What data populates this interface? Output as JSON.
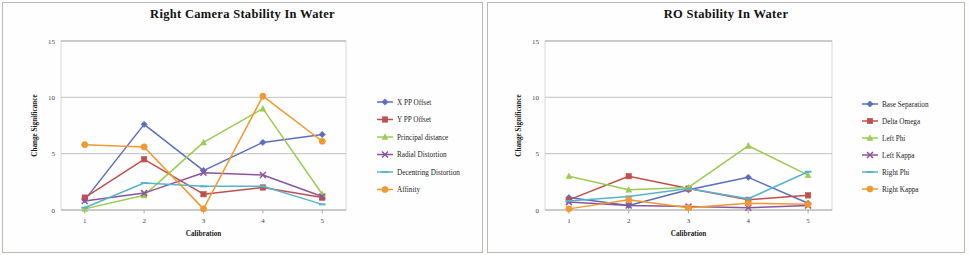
{
  "page": {
    "background_color": "#fdfdfb",
    "panel_border_color": "#b9b9b9"
  },
  "charts": [
    {
      "id": "right-camera-stability",
      "title": "Right Camera Stability In Water",
      "xlabel": "Calibration",
      "ylabel": "Change Significance"
    },
    {
      "id": "ro-stability",
      "title": "RO Stability In Water",
      "xlabel": "Calibration",
      "ylabel": "Change Significance"
    }
  ],
  "chart_data": [
    {
      "type": "line",
      "title": "Right Camera Stability In Water",
      "xlabel": "Calibration",
      "ylabel": "Change Significance",
      "categories": [
        "1",
        "2",
        "3",
        "4",
        "5"
      ],
      "x": [
        1,
        2,
        3,
        4,
        5
      ],
      "xlim": [
        0.6,
        5.4
      ],
      "ylim": [
        0,
        15
      ],
      "yticks": [
        0,
        5,
        10,
        15
      ],
      "ytick_labels": [
        "0",
        "5",
        "10",
        "15"
      ],
      "grid": true,
      "legend_position": "right",
      "series": [
        {
          "name": "X PP Offset",
          "color": "#5b6fbd",
          "marker": "diamond",
          "values": [
            0.9,
            7.6,
            3.5,
            6.0,
            6.7
          ]
        },
        {
          "name": "Y PP Offset",
          "color": "#c0504d",
          "marker": "square",
          "values": [
            1.1,
            4.5,
            1.4,
            2.0,
            1.1
          ]
        },
        {
          "name": "Principal distance",
          "color": "#9bcb50",
          "marker": "triangle",
          "values": [
            0.1,
            1.3,
            6.0,
            9.0,
            1.4
          ]
        },
        {
          "name": "Radial Distortion",
          "color": "#8b559c",
          "marker": "cross",
          "values": [
            0.8,
            1.5,
            3.3,
            3.1,
            1.2
          ]
        },
        {
          "name": "Decentring Distortion",
          "color": "#57b4cd",
          "marker": "line",
          "values": [
            0.2,
            2.4,
            2.1,
            2.1,
            0.5
          ]
        },
        {
          "name": "Affinity",
          "color": "#f0992f",
          "marker": "circle",
          "values": [
            5.8,
            5.6,
            0.1,
            10.1,
            6.1
          ]
        }
      ]
    },
    {
      "type": "line",
      "title": "RO Stability In Water",
      "xlabel": "Calibration",
      "ylabel": "Change Significance",
      "categories": [
        "1",
        "2",
        "3",
        "4",
        "5"
      ],
      "x": [
        1,
        2,
        3,
        4,
        5
      ],
      "xlim": [
        0.6,
        5.4
      ],
      "ylim": [
        0,
        15
      ],
      "yticks": [
        0,
        5,
        10,
        15
      ],
      "ytick_labels": [
        "0",
        "5",
        "10",
        "15"
      ],
      "grid": true,
      "legend_position": "right",
      "series": [
        {
          "name": "Base Separation",
          "color": "#5b6fbd",
          "marker": "diamond",
          "values": [
            1.1,
            0.4,
            1.8,
            2.9,
            0.6
          ]
        },
        {
          "name": "Delta Omega",
          "color": "#c0504d",
          "marker": "square",
          "values": [
            0.9,
            3.0,
            1.9,
            0.9,
            1.3
          ]
        },
        {
          "name": "Left Phi",
          "color": "#9bcb50",
          "marker": "triangle",
          "values": [
            3.0,
            1.8,
            2.0,
            5.7,
            3.1
          ]
        },
        {
          "name": "Left Kappa",
          "color": "#8b559c",
          "marker": "cross",
          "values": [
            0.7,
            0.4,
            0.3,
            0.2,
            0.4
          ]
        },
        {
          "name": "Right Phi",
          "color": "#57b4cd",
          "marker": "line",
          "values": [
            0.8,
            1.2,
            1.9,
            1.0,
            3.4
          ]
        },
        {
          "name": "Right Kappa",
          "color": "#f0992f",
          "marker": "circle",
          "values": [
            0.1,
            0.9,
            0.2,
            0.6,
            0.5
          ]
        }
      ]
    }
  ]
}
